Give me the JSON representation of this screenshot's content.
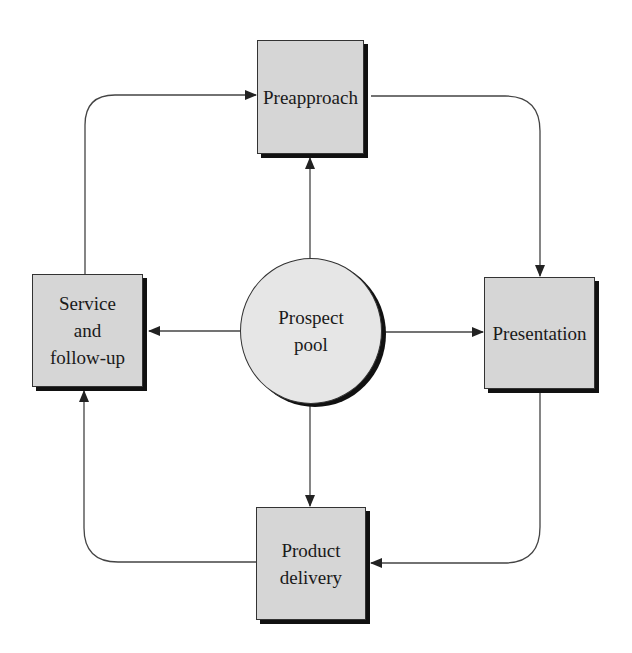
{
  "diagram": {
    "type": "cycle-flow",
    "center": {
      "id": "prospect-pool",
      "label_lines": [
        "Prospect",
        "pool"
      ]
    },
    "nodes": [
      {
        "id": "preapproach",
        "label_lines": [
          "Preapproach"
        ]
      },
      {
        "id": "presentation",
        "label_lines": [
          "Presentation"
        ]
      },
      {
        "id": "product-delivery",
        "label_lines": [
          "Product",
          "delivery"
        ]
      },
      {
        "id": "service-follow-up",
        "label_lines": [
          "Service",
          "and",
          "follow-up"
        ]
      }
    ],
    "edges": [
      {
        "from": "prospect-pool",
        "to": "preapproach"
      },
      {
        "from": "prospect-pool",
        "to": "presentation"
      },
      {
        "from": "prospect-pool",
        "to": "product-delivery"
      },
      {
        "from": "prospect-pool",
        "to": "service-follow-up"
      },
      {
        "from": "preapproach",
        "to": "presentation"
      },
      {
        "from": "presentation",
        "to": "product-delivery"
      },
      {
        "from": "product-delivery",
        "to": "service-follow-up"
      },
      {
        "from": "service-follow-up",
        "to": "preapproach"
      }
    ],
    "colors": {
      "box_fill": "#d6d6d6",
      "circle_fill": "#e6e6e6",
      "stroke": "#333333",
      "shadow": "#111111"
    }
  }
}
